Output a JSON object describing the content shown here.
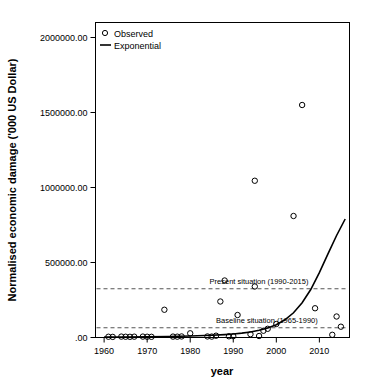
{
  "chart_data": {
    "type": "scatter",
    "title": "",
    "xlabel": "year",
    "ylabel": "Normalised economic damage ('000 US Dollar)",
    "xlim": [
      1958,
      2017
    ],
    "ylim": [
      0,
      2100000
    ],
    "grid": false,
    "legend_position": "top-left",
    "x_ticks": [
      1960,
      1970,
      1980,
      1990,
      2000,
      2010
    ],
    "x_tick_labels": [
      "1960",
      "1970",
      "1980",
      "1990",
      "2000",
      "2010"
    ],
    "y_ticks": [
      0,
      500000,
      1000000,
      1500000,
      2000000
    ],
    "y_tick_labels": [
      ".00",
      "500000.00",
      "1000000.00",
      "1500000.00",
      "2000000.00"
    ],
    "legend": [
      {
        "name": "Observed",
        "marker": "circle-open"
      },
      {
        "name": "Exponential",
        "marker": "line"
      }
    ],
    "series": [
      {
        "name": "Observed",
        "type": "scatter",
        "marker": "circle-open",
        "points": [
          {
            "x": 1961,
            "y": 5000
          },
          {
            "x": 1962,
            "y": 4000
          },
          {
            "x": 1964,
            "y": 6000
          },
          {
            "x": 1965,
            "y": 5000
          },
          {
            "x": 1966,
            "y": 4500
          },
          {
            "x": 1967,
            "y": 5500
          },
          {
            "x": 1969,
            "y": 6000
          },
          {
            "x": 1970,
            "y": 5000
          },
          {
            "x": 1971,
            "y": 4500
          },
          {
            "x": 1974,
            "y": 185000
          },
          {
            "x": 1976,
            "y": 6000
          },
          {
            "x": 1977,
            "y": 5500
          },
          {
            "x": 1978,
            "y": 7000
          },
          {
            "x": 1980,
            "y": 28000
          },
          {
            "x": 1984,
            "y": 7000
          },
          {
            "x": 1985,
            "y": 6000
          },
          {
            "x": 1986,
            "y": 12000
          },
          {
            "x": 1987,
            "y": 240000
          },
          {
            "x": 1988,
            "y": 380000
          },
          {
            "x": 1989,
            "y": 8000
          },
          {
            "x": 1990,
            "y": 9000
          },
          {
            "x": 1991,
            "y": 150000
          },
          {
            "x": 1994,
            "y": 22000
          },
          {
            "x": 1995,
            "y": 1045000
          },
          {
            "x": 1995,
            "y": 340000
          },
          {
            "x": 1996,
            "y": 10000
          },
          {
            "x": 1997,
            "y": 45000
          },
          {
            "x": 1998,
            "y": 58000
          },
          {
            "x": 2000,
            "y": 90000
          },
          {
            "x": 2004,
            "y": 810000
          },
          {
            "x": 2006,
            "y": 1550000
          },
          {
            "x": 2009,
            "y": 195000
          },
          {
            "x": 2013,
            "y": 18000
          },
          {
            "x": 2014,
            "y": 140000
          },
          {
            "x": 2015,
            "y": 72000
          }
        ]
      },
      {
        "name": "Exponential",
        "type": "line",
        "points": [
          {
            "x": 1960,
            "y": 2500
          },
          {
            "x": 1965,
            "y": 3400
          },
          {
            "x": 1970,
            "y": 4700
          },
          {
            "x": 1975,
            "y": 6500
          },
          {
            "x": 1980,
            "y": 9500
          },
          {
            "x": 1985,
            "y": 14500
          },
          {
            "x": 1988,
            "y": 19000
          },
          {
            "x": 1990,
            "y": 23000
          },
          {
            "x": 1992,
            "y": 29000
          },
          {
            "x": 1994,
            "y": 37000
          },
          {
            "x": 1996,
            "y": 48000
          },
          {
            "x": 1998,
            "y": 63000
          },
          {
            "x": 2000,
            "y": 85000
          },
          {
            "x": 2002,
            "y": 118000
          },
          {
            "x": 2004,
            "y": 165000
          },
          {
            "x": 2006,
            "y": 232000
          },
          {
            "x": 2008,
            "y": 320000
          },
          {
            "x": 2010,
            "y": 432000
          },
          {
            "x": 2012,
            "y": 558000
          },
          {
            "x": 2014,
            "y": 680000
          },
          {
            "x": 2016,
            "y": 790000
          }
        ]
      }
    ],
    "reference_lines": [
      {
        "label": "Present situation (1990-2015)",
        "y": 325000,
        "style": "dashed"
      },
      {
        "label": "Baseline situation (1965-1990)",
        "y": 65000,
        "style": "dashed"
      }
    ],
    "annotations": [
      {
        "text": "Present situation (1990-2015)",
        "x": 1984.5,
        "y": 360000
      },
      {
        "text": "Baseline situation (1965-1990)",
        "x": 1986.0,
        "y": 96000
      }
    ]
  },
  "colors": {
    "background": "#ffffff",
    "axis": "#000000",
    "marker": "#000000",
    "fit_line": "#000000",
    "reference_line": "#555555"
  }
}
